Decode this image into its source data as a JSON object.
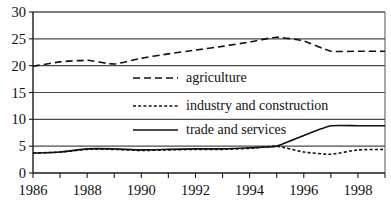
{
  "chart_data": {
    "type": "line",
    "title": "",
    "subtitle": "",
    "xlabel": "",
    "ylabel": "",
    "xlim": [
      1986,
      1999
    ],
    "ylim": [
      0,
      30
    ],
    "grid": true,
    "legend_position": "center-right inside plot area",
    "x": [
      1986,
      1987,
      1988,
      1989,
      1990,
      1991,
      1992,
      1993,
      1994,
      1995,
      1996,
      1997,
      1998,
      1999
    ],
    "x_tick_labels": [
      "1986",
      "1988",
      "1990",
      "1992",
      "1994",
      "1996",
      "1998"
    ],
    "x_tick_values": [
      1986,
      1988,
      1990,
      1992,
      1994,
      1996,
      1998
    ],
    "x_minor_ticks": [
      1986,
      1987,
      1988,
      1989,
      1990,
      1991,
      1992,
      1993,
      1994,
      1995,
      1996,
      1997,
      1998,
      1999
    ],
    "y_tick_labels": [
      "0",
      "5",
      "10",
      "15",
      "20",
      "25",
      "30"
    ],
    "y_tick_values": [
      0,
      5,
      10,
      15,
      20,
      25,
      30
    ],
    "series": [
      {
        "name": "agriculture",
        "style": "long-dash",
        "dasharray": "7,4",
        "values": [
          19.9,
          20.7,
          21.0,
          20.3,
          21.4,
          22.2,
          22.9,
          23.6,
          24.4,
          25.3,
          24.6,
          22.7,
          22.7,
          22.7
        ]
      },
      {
        "name": "industry and construction",
        "style": "short-dash",
        "dasharray": "3,2.2",
        "values": [
          3.7,
          3.9,
          4.4,
          4.4,
          4.2,
          4.3,
          4.4,
          4.4,
          4.6,
          5.0,
          3.9,
          3.5,
          4.3,
          4.4
        ]
      },
      {
        "name": "trade and services",
        "style": "solid",
        "dasharray": "none",
        "values": [
          3.7,
          3.9,
          4.5,
          4.5,
          4.3,
          4.4,
          4.5,
          4.5,
          4.7,
          5.0,
          7.0,
          8.8,
          8.8,
          8.8
        ]
      }
    ],
    "legend": [
      {
        "label": "agriculture",
        "style": "long-dash"
      },
      {
        "label": "industry and construction",
        "style": "short-dash"
      },
      {
        "label": "trade and services",
        "style": "solid"
      }
    ],
    "colors": {
      "series_stroke": "#111111",
      "gridline": "#4a4a4a",
      "axis": "#1a1a1a",
      "background": "#ffffff",
      "text": "#111111"
    }
  }
}
